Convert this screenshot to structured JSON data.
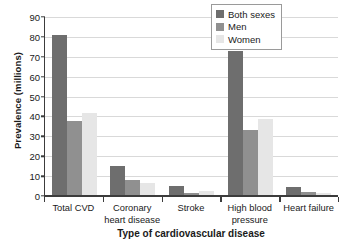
{
  "chart_data": {
    "type": "bar",
    "title": "",
    "xlabel": "Type of cardiovascular disease",
    "ylabel": "Prevalence (millions)",
    "categories": [
      "Total CVD",
      "Coronary heart disease",
      "Stroke",
      "High blood pressure",
      "Heart failure"
    ],
    "category_lines": [
      [
        "Total CVD"
      ],
      [
        "Coronary",
        "heart disease"
      ],
      [
        "Stroke"
      ],
      [
        "High blood",
        "pressure"
      ],
      [
        "Heart failure"
      ]
    ],
    "series": [
      {
        "name": "Both sexes",
        "color": "#6e6e6e",
        "values": [
          81,
          15.2,
          5.2,
          72.8,
          4.5
        ]
      },
      {
        "name": "Men",
        "color": "#909090",
        "values": [
          37.5,
          8.0,
          1.3,
          33.4,
          1.8
        ]
      },
      {
        "name": "Women",
        "color": "#e6e6e6",
        "values": [
          41.8,
          6.5,
          2.3,
          38.5,
          1.7
        ]
      }
    ],
    "ylim": [
      0,
      90
    ],
    "ytick_step": 10,
    "yticks": [
      "0",
      "10",
      "20",
      "30",
      "40",
      "50",
      "60",
      "70",
      "80",
      "90"
    ],
    "grid": "horizontal",
    "legend_position": "top-right-inside"
  }
}
